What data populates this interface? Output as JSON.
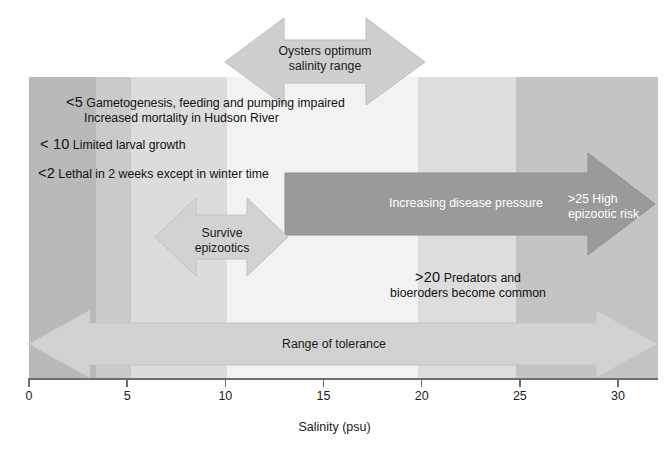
{
  "figure": {
    "axis_title": "Salinity (psu)"
  },
  "axis": {
    "label": "Salinity (psu)",
    "ticks": [
      "0",
      "5",
      "10",
      "15",
      "20",
      "25",
      "30"
    ],
    "min": 0,
    "max": 30,
    "unit": "psu"
  },
  "arrows": {
    "optimum": {
      "label_line1": "Oysters optimum",
      "label_line2": "salinity range"
    },
    "survive": {
      "label_line1": "Survive",
      "label_line2": "epizootics"
    },
    "tolerance": {
      "label": "Range of tolerance"
    },
    "disease": {
      "label": "Increasing disease pressure",
      "risk_line1": ">25 High",
      "risk_line2": "epizootic risk"
    }
  },
  "annotations": {
    "lethal": {
      "threshold": "<2",
      "text": "Lethal in 2 weeks except in winter time"
    },
    "gametogenesis": {
      "threshold": "<5",
      "line1": "Gametogenesis, feeding and pumping impaired",
      "line2": "Increased mortality in Hudson River"
    },
    "larval": {
      "threshold": "< 10",
      "text": "Limited larval growth"
    },
    "predators": {
      "threshold": ">20",
      "line1": "Predators and",
      "line2": "bioeroders become common"
    }
  },
  "colors": {
    "band_darkest": "#b9b9b9",
    "band_dark": "#cacaca",
    "band_mid": "#dcdcdc",
    "band_lightest": "#f2f2f2",
    "band_light_mid": "#dddddd",
    "band_right_dark": "#c4c4c4",
    "arrow_light": "#cfcfcf",
    "arrow_dark": "#9a9a9a",
    "axis": "#6e6e6e",
    "text": "#1a1a1a",
    "text_on_dark": "#ffffff"
  },
  "chart_data": {
    "type": "diagram",
    "xlabel": "Salinity (psu)",
    "ylabel": "",
    "xlim": [
      0,
      30
    ],
    "grid": false,
    "legend": "none",
    "bands": [
      {
        "name": "very-low-salinity",
        "from": 0,
        "to": 3.4,
        "color": "#b9b9b9"
      },
      {
        "name": "low-salinity",
        "from": 3.4,
        "to": 5.2,
        "color": "#cacaca"
      },
      {
        "name": "low-mid-salinity",
        "from": 5.2,
        "to": 10.1,
        "color": "#dcdcdc"
      },
      {
        "name": "optimum-salinity",
        "from": 10.1,
        "to": 19.8,
        "color": "#f2f2f2"
      },
      {
        "name": "high-mid-salinity",
        "from": 19.8,
        "to": 24.8,
        "color": "#dddddd"
      },
      {
        "name": "high-salinity",
        "from": 24.8,
        "to": 32.0,
        "color": "#c4c4c4"
      }
    ],
    "ranges": [
      {
        "name": "Oysters optimum salinity range",
        "from": 10.0,
        "to": 20.2,
        "style": "double-arrow"
      },
      {
        "name": "Survive epizootics",
        "from": 6.4,
        "to": 13.2,
        "style": "double-arrow"
      },
      {
        "name": "Range of tolerance",
        "from": 0.0,
        "to": 31.0,
        "style": "double-arrow"
      },
      {
        "name": "Increasing disease pressure",
        "from": 13.0,
        "to": 31.0,
        "style": "right-arrow"
      }
    ],
    "thresholds": [
      {
        "label": "<2",
        "value": 2,
        "text": "Lethal in 2 weeks except in winter time"
      },
      {
        "label": "<5",
        "value": 5,
        "text": "Gametogenesis, feeding and pumping impaired; Increased mortality in Hudson River"
      },
      {
        "label": "<10",
        "value": 10,
        "text": "Limited larval growth"
      },
      {
        "label": ">20",
        "value": 20,
        "text": "Predators and bioeroders become common"
      },
      {
        "label": ">25",
        "value": 25,
        "text": "High epizootic risk"
      }
    ]
  }
}
